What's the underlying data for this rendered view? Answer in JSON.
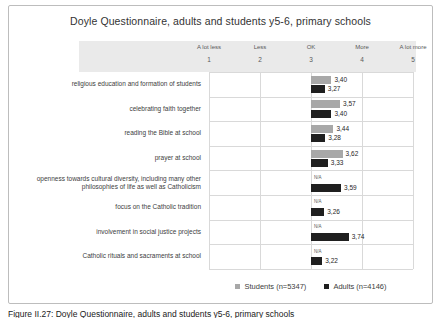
{
  "page": {
    "caption": "Figure II.27: Doyle Questionnaire, adults and students y5-6, primary schools"
  },
  "chart_data": {
    "type": "bar",
    "orientation": "horizontal",
    "title": "Doyle Questionnaire, adults and students y5-6, primary schools",
    "bar_baseline": 3,
    "xlim": [
      1,
      5
    ],
    "x_ticks": [
      1,
      2,
      3,
      4,
      5
    ],
    "x_tick_labels": [
      "A lot less",
      "Less",
      "OK",
      "More",
      "A lot more"
    ],
    "grid": true,
    "legend_position": "bottom",
    "na_label": "N/A",
    "categories": [
      "religious education and formation of students",
      "celebrating faith together",
      "reading the Bible at school",
      "prayer at school",
      "openness towards cultural diversity, including many other philosophies of life as well as Catholicism",
      "focus on the Catholic tradition",
      "involvement in social justice projects",
      "Catholic rituals and sacraments at school"
    ],
    "series": [
      {
        "name": "Students (n=5347)",
        "color": "#a8a8a8",
        "values": [
          3.4,
          3.57,
          3.44,
          3.62,
          null,
          null,
          null,
          null
        ],
        "value_labels": [
          "3,40",
          "3,57",
          "3,44",
          "3,62",
          "N/A",
          "N/A",
          "N/A",
          "N/A"
        ]
      },
      {
        "name": "Adults (n=4146)",
        "color": "#1f1f1f",
        "values": [
          3.27,
          3.4,
          3.28,
          3.33,
          3.59,
          3.26,
          3.74,
          3.22
        ],
        "value_labels": [
          "3,27",
          "3,40",
          "3,28",
          "3,33",
          "3,59",
          "3,26",
          "3,74",
          "3,22"
        ]
      }
    ],
    "colors": {
      "header_band": "#eaeaea",
      "gridline": "#d9d9d9",
      "students_bar": "#a8a8a8",
      "adults_bar": "#1f1f1f"
    }
  }
}
